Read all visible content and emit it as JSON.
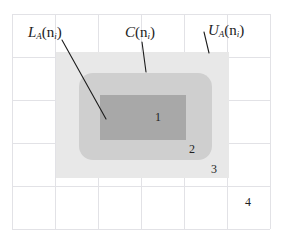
{
  "figure": {
    "background_color": "#ffffff",
    "grid": {
      "line_color": "#e2e2e6",
      "x0": 12,
      "y0": 14,
      "cell_w": 43,
      "cell_h": 43,
      "cols": 6,
      "rows": 5
    },
    "regions": [
      {
        "name": "upper-approximation-region",
        "shape": "rect",
        "fill": "#e8e8e8",
        "x": 56,
        "y": 52,
        "width": 173,
        "height": 126,
        "radius": 0
      },
      {
        "name": "boundary-region",
        "shape": "rounded-rect",
        "fill": "#cfcfcf",
        "x": 79,
        "y": 73,
        "width": 133,
        "height": 87,
        "radius": 14
      },
      {
        "name": "lower-approximation-region",
        "shape": "rect",
        "fill": "#a8a8a8",
        "x": 100,
        "y": 95,
        "width": 86,
        "height": 45,
        "radius": 0
      }
    ],
    "leaders": [
      {
        "name": "lower-approximation-leader",
        "x1": 62,
        "y1": 40,
        "x2": 106,
        "y2": 119
      },
      {
        "name": "boundary-leader",
        "x1": 142,
        "y1": 42,
        "x2": 146,
        "y2": 72
      },
      {
        "name": "upper-approximation-leader",
        "x1": 204,
        "y1": 32,
        "x2": 209,
        "y2": 53
      }
    ],
    "leader_color": "#1c1c1c"
  },
  "labels": {
    "lower": {
      "base": "L",
      "sub": "A",
      "arg": "(n",
      "arg_sub": "i",
      "arg_close": ")",
      "x": 28,
      "y": 24
    },
    "core": {
      "base": "C",
      "sub": "",
      "arg": "(n",
      "arg_sub": "i",
      "arg_close": ")",
      "x": 125,
      "y": 24
    },
    "upper": {
      "base": "U",
      "sub": "A",
      "arg": "(n",
      "arg_sub": "i",
      "arg_close": ")",
      "x": 208,
      "y": 22
    }
  },
  "markers": [
    {
      "name": "region-marker-1",
      "text": "1",
      "x": 155,
      "y": 111
    },
    {
      "name": "region-marker-2",
      "text": "2",
      "x": 189,
      "y": 143
    },
    {
      "name": "region-marker-3",
      "text": "3",
      "x": 211,
      "y": 163
    },
    {
      "name": "region-marker-4",
      "text": "4",
      "x": 245,
      "y": 196
    }
  ]
}
